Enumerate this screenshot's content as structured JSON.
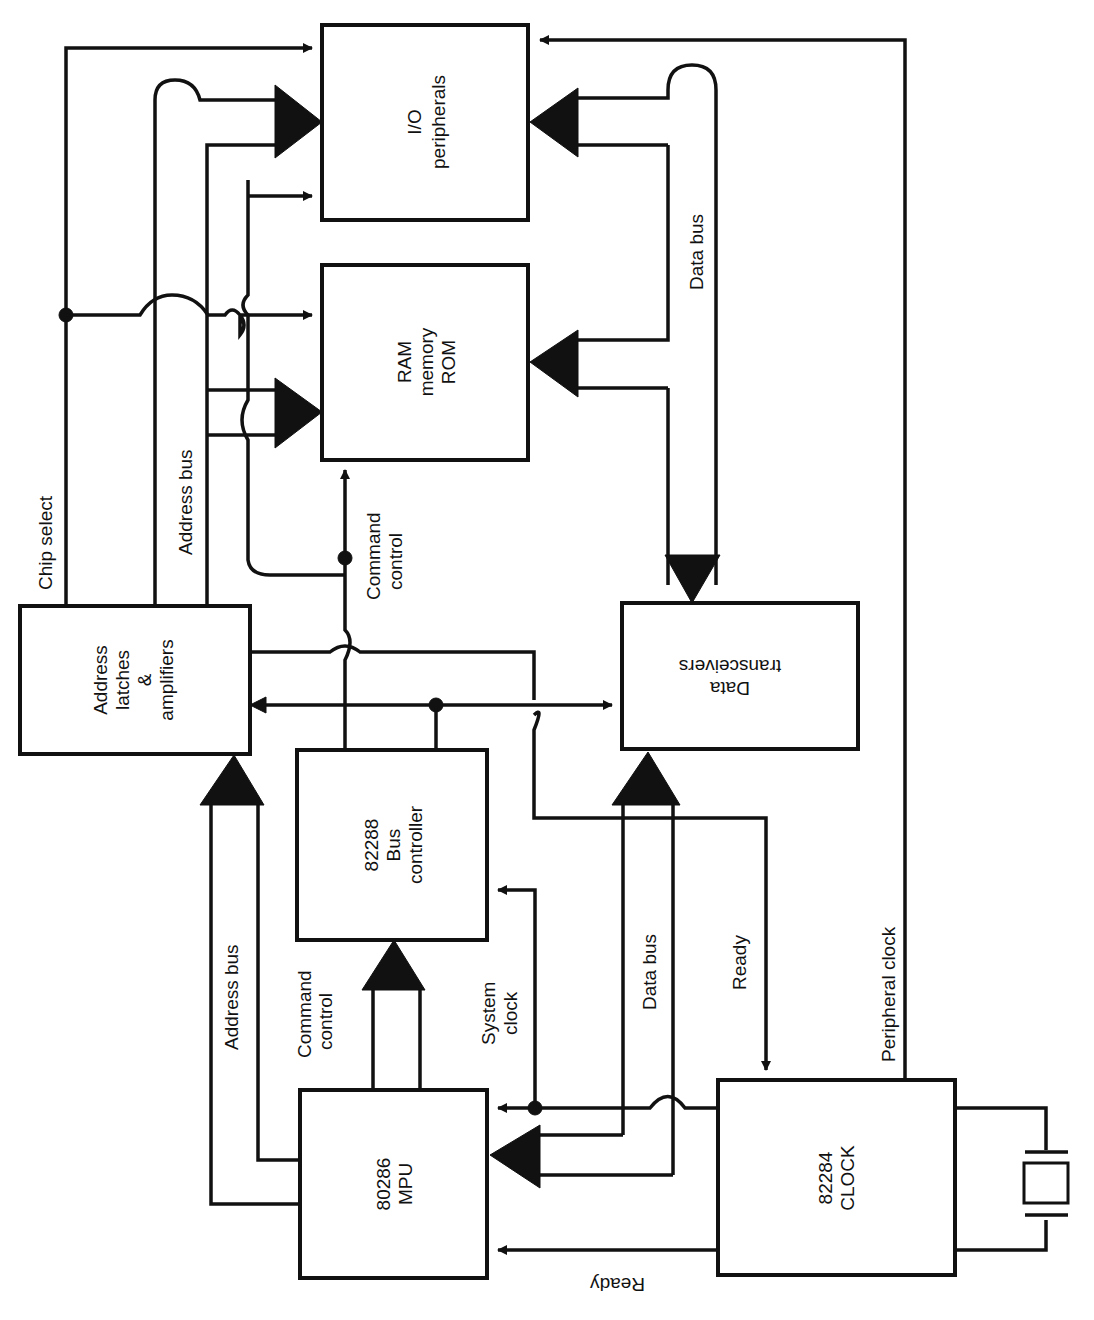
{
  "diagram": {
    "orientation": "rotated 90 degrees counter-clockwise",
    "colors": {
      "ink": "#111111",
      "background": "#ffffff"
    },
    "blocks": {
      "io": {
        "line1": "I/O",
        "line2": "peripherals"
      },
      "ram": {
        "line1": "RAM",
        "line2": "memory",
        "line3": "ROM"
      },
      "latch": {
        "line1": "Address",
        "line2": "latches",
        "line3": "&",
        "line4": "amplifiers"
      },
      "busctl": {
        "line1": "82288",
        "line2": "Bus",
        "line3": "controller"
      },
      "xcvr": {
        "line1": "Data",
        "line2": "transceivers"
      },
      "mpu": {
        "line1": "80286",
        "line2": "MPU"
      },
      "clock": {
        "line1": "82284",
        "line2": "CLOCK"
      }
    },
    "labels": {
      "chip_select": "Chip select",
      "address_bus_top": "Address bus",
      "command_control_top_1": "Command",
      "command_control_top_2": "control",
      "data_bus_top": "Data bus",
      "address_bus_bottom": "Address bus",
      "command_control_bottom_1": "Command",
      "command_control_bottom_2": "control",
      "system_clock_1": "System",
      "system_clock_2": "clock",
      "data_bus_bottom": "Data bus",
      "ready_right": "Ready",
      "peripheral_clock": "Peripheral clock",
      "ready_bottom": "Ready"
    },
    "components": {
      "crystal": "crystal-oscillator-symbol"
    }
  }
}
